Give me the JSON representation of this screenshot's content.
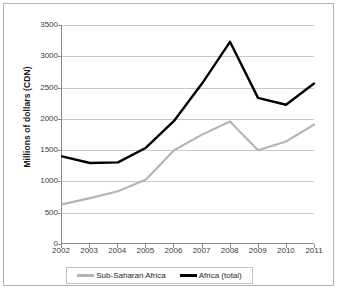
{
  "chart_data": {
    "type": "line",
    "title": "",
    "subtitle": "",
    "xlabel": "",
    "ylabel": "Millions of dollars (CDN)",
    "categories": [
      "2002",
      "2003",
      "2004",
      "2005",
      "2006",
      "2007",
      "2008",
      "2009",
      "2010",
      "2011"
    ],
    "x": [
      2002,
      2003,
      2004,
      2005,
      2006,
      2007,
      2008,
      2009,
      2010,
      2011
    ],
    "xlim": [
      2002,
      2011
    ],
    "ylim": [
      0,
      3500
    ],
    "yticks": [
      0,
      500,
      1000,
      1500,
      2000,
      2500,
      3000,
      3500
    ],
    "ytick_labels": [
      "0",
      "500",
      "1000",
      "1500",
      "2000",
      "2500",
      "3000",
      "3500"
    ],
    "grid": "horizontal",
    "legend_position": "bottom",
    "series": [
      {
        "name": "Sub-Saharan Africa",
        "color": "#b4b4b4",
        "values": [
          620,
          720,
          830,
          1020,
          1490,
          1740,
          1950,
          1490,
          1630,
          1900
        ]
      },
      {
        "name": "Africa (total)",
        "color": "#000000",
        "values": [
          1390,
          1285,
          1295,
          1530,
          1960,
          2560,
          3230,
          2330,
          2220,
          2560
        ]
      }
    ]
  },
  "legend": {
    "entries": [
      {
        "label": "Sub-Saharan Africa",
        "color": "#b4b4b4"
      },
      {
        "label": "Africa (total)",
        "color": "#000000"
      }
    ]
  },
  "axis": {
    "y_title": "Millions of dollars (CDN)"
  },
  "colors": {
    "frame": "#b0b0b0",
    "axis": "#8a8a8a",
    "gridline": "#c8c8c8",
    "tick_text": "#3a3a3a",
    "series_gray": "#b4b4b4",
    "series_black": "#000000"
  }
}
